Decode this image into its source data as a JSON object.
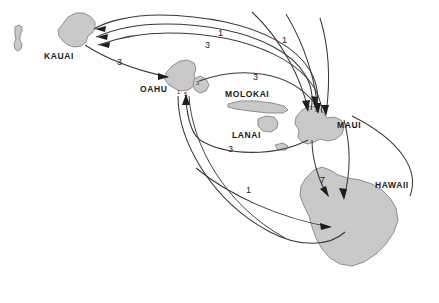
{
  "figure": {
    "background_color": "#ffffff",
    "island_fill_color": "#c9c9c9",
    "island_stroke_color": "#8e8e8e",
    "arrow_color": "#3a3a3a",
    "width": 439,
    "height": 303
  },
  "islands": [
    {
      "name": "niihau",
      "label": "",
      "label_x": 0,
      "label_y": 0
    },
    {
      "name": "kauai",
      "label": "KAUAI",
      "label_x": 44,
      "label_y": 52
    },
    {
      "name": "oahu",
      "label": "OAHU",
      "label_x": 140,
      "label_y": 85
    },
    {
      "name": "molokai",
      "label": "MOLOKAI",
      "label_x": 225,
      "label_y": 90
    },
    {
      "name": "lanai",
      "label": "LANAI",
      "label_x": 232,
      "label_y": 131
    },
    {
      "name": "maui",
      "label": "MAUI",
      "label_x": 337,
      "label_y": 121
    },
    {
      "name": "hawaii",
      "label": "HAWAII",
      "label_x": 375,
      "label_y": 181
    }
  ],
  "flows": [
    {
      "name": "maui-to-kauai-outer",
      "value": "1",
      "label_x": 282,
      "label_y": 36,
      "from": "MAUI",
      "to": "KAUAI"
    },
    {
      "name": "maui-to-kauai-inner",
      "value": "1",
      "label_x": 218,
      "label_y": 29,
      "from": "MAUI",
      "to": "KAUAI"
    },
    {
      "name": "hawaii-to-kauai",
      "value": "3",
      "label_x": 205,
      "label_y": 41,
      "from": "HAWAII",
      "to": "KAUAI"
    },
    {
      "name": "kauai-to-oahu",
      "value": "3",
      "label_x": 117,
      "label_y": 58,
      "from": "KAUAI",
      "to": "OAHU"
    },
    {
      "name": "oahu-to-maui-upper",
      "value": "3",
      "label_x": 253,
      "label_y": 73,
      "from": "OAHU",
      "to": "MAUI"
    },
    {
      "name": "maui-to-oahu-lower",
      "value": "3",
      "label_x": 228,
      "label_y": 145,
      "from": "MAUI",
      "to": "OAHU"
    },
    {
      "name": "maui-to-hawaii",
      "value": "7",
      "label_x": 320,
      "label_y": 176,
      "from": "MAUI",
      "to": "HAWAII"
    },
    {
      "name": "oahu-to-hawaii",
      "value": "1",
      "label_x": 246,
      "label_y": 186,
      "from": "OAHU",
      "to": "HAWAII"
    },
    {
      "name": "oahu-inbound-marker-a",
      "value": "1",
      "label_x": 177,
      "label_y": 90,
      "from": "",
      "to": "OAHU"
    },
    {
      "name": "oahu-inbound-marker-b",
      "value": "5",
      "label_x": 184,
      "label_y": 92,
      "from": "",
      "to": "OAHU"
    },
    {
      "name": "maui-side-marker",
      "value": "3",
      "label_x": 196,
      "label_y": 81,
      "from": "",
      "to": "OAHU"
    }
  ]
}
